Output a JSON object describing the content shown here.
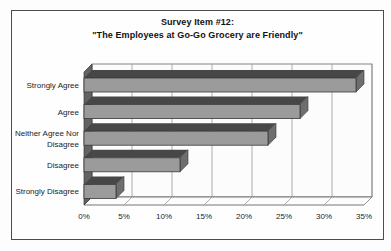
{
  "chart_data": {
    "type": "bar",
    "orientation": "horizontal",
    "effect": "3d",
    "title": "Survey Item #12: \"The Employees at Go-Go Grocery are Friendly\"",
    "title_lines": [
      "Survey Item #12:",
      "\"The Employees at Go-Go Grocery are Friendly\""
    ],
    "categories": [
      "Strongly Agree",
      "Agree",
      "Neither Agree Nor Disagree",
      "Disagree",
      "Strongly Disagree"
    ],
    "category_display": [
      [
        "Strongly Agree"
      ],
      [
        "Agree"
      ],
      [
        "Neither Agree Nor",
        "Disagree"
      ],
      [
        "Disagree"
      ],
      [
        "Strongly Disagree"
      ]
    ],
    "values": [
      34,
      27,
      23,
      12,
      4
    ],
    "unit": "%",
    "xlabel": "",
    "ylabel": "",
    "xlim": [
      0,
      35
    ],
    "xtick_values": [
      0,
      5,
      10,
      15,
      20,
      25,
      30,
      35
    ],
    "xtick_labels": [
      "0%",
      "5%",
      "10%",
      "15%",
      "20%",
      "25%",
      "30%",
      "35%"
    ],
    "grid": true,
    "legend": null,
    "colors": {
      "bar_front": "#9b9b9b",
      "bar_top": "#474747",
      "bar_side": "#6e6e6e",
      "bar_outline": "#383838",
      "wall_fill": "#fcfcfc",
      "wall_stroke": "#666666",
      "gridline": "#999999",
      "left_wall": "#636363",
      "text": "#1d1d1d",
      "frame_border": "#4d4d4d",
      "background": "#ffffff"
    }
  }
}
